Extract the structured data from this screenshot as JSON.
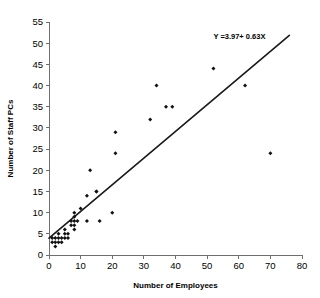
{
  "chart_data": {
    "type": "scatter",
    "title": "",
    "xlabel": "Number of Employees",
    "ylabel": "Number of Staff PCs",
    "xlim": [
      0,
      80
    ],
    "ylim": [
      0,
      55
    ],
    "xticks": [
      0,
      10,
      20,
      30,
      40,
      50,
      60,
      70,
      80
    ],
    "yticks": [
      0,
      5,
      10,
      15,
      20,
      25,
      30,
      35,
      40,
      45,
      50,
      55
    ],
    "grid": false,
    "legend": false,
    "annotations": [
      {
        "name": "regression-equation",
        "text": "Y =3.97+ 0.63X",
        "x": 52,
        "y": 51
      }
    ],
    "series": [
      {
        "name": "Staff PCs vs Employees",
        "marker": "diamond",
        "color": "#111111",
        "points": [
          [
            1,
            3
          ],
          [
            1,
            4
          ],
          [
            2,
            2
          ],
          [
            2,
            3
          ],
          [
            2,
            4
          ],
          [
            3,
            3
          ],
          [
            3,
            4
          ],
          [
            3,
            5
          ],
          [
            4,
            4
          ],
          [
            4,
            3
          ],
          [
            5,
            4
          ],
          [
            5,
            5
          ],
          [
            5,
            6
          ],
          [
            6,
            4
          ],
          [
            6,
            5
          ],
          [
            7,
            7
          ],
          [
            7,
            8
          ],
          [
            8,
            6
          ],
          [
            8,
            7
          ],
          [
            8,
            8
          ],
          [
            8,
            9
          ],
          [
            8,
            10
          ],
          [
            9,
            8
          ],
          [
            10,
            11
          ],
          [
            12,
            14
          ],
          [
            12,
            8
          ],
          [
            13,
            20
          ],
          [
            15,
            15
          ],
          [
            15,
            15
          ],
          [
            16,
            8
          ],
          [
            20,
            10
          ],
          [
            21,
            24
          ],
          [
            21,
            29
          ],
          [
            32,
            32
          ],
          [
            34,
            40
          ],
          [
            37,
            35
          ],
          [
            39,
            35
          ],
          [
            52,
            44
          ],
          [
            62,
            40
          ],
          [
            70,
            24
          ]
        ]
      }
    ],
    "fit_line": {
      "name": "least-squares-fit",
      "intercept": 3.97,
      "slope": 0.63,
      "x_start": 0,
      "x_end": 76,
      "color": "#1a1a1a"
    }
  },
  "axes": {
    "x_title": "Number of Employees",
    "y_title": "Number of Staff PCs",
    "x_tick_labels": [
      "0",
      "10",
      "20",
      "30",
      "40",
      "50",
      "60",
      "70",
      "80"
    ],
    "y_tick_labels": [
      "0",
      "5",
      "10",
      "15",
      "20",
      "25",
      "30",
      "35",
      "40",
      "45",
      "50",
      "55"
    ]
  }
}
